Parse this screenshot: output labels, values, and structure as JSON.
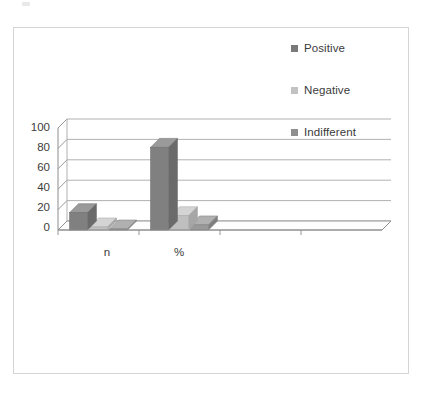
{
  "chart_data": {
    "type": "bar",
    "title": "",
    "subtitle": "",
    "xlabel": "",
    "ylabel": "",
    "categories": [
      "n",
      "%"
    ],
    "series": [
      {
        "name": "Positive",
        "values": [
          17,
          81
        ],
        "color": "#808080"
      },
      {
        "name": "Negative",
        "values": [
          3,
          14
        ],
        "color": "#bfbfbf"
      },
      {
        "name": "Indifferent",
        "values": [
          1,
          5
        ],
        "color": "#999999"
      }
    ],
    "yticks": [
      0,
      20,
      40,
      60,
      80,
      100
    ],
    "ylim": [
      0,
      100
    ],
    "grid": true,
    "legend_position": "right",
    "style": "3d-clustered-column",
    "empty_category_slots": 2
  },
  "legend": {
    "items": [
      {
        "label": "Positive",
        "swatch_color": "#7a7a7a"
      },
      {
        "label": "Negative",
        "swatch_color": "#c2c2c2"
      },
      {
        "label": "Indifferent",
        "swatch_color": "#8f8f8f"
      }
    ]
  },
  "axis": {
    "y_tick_labels": [
      "100",
      "80",
      "60",
      "40",
      "20",
      "0"
    ],
    "x_tick_labels": [
      "n",
      "%"
    ]
  },
  "colors": {
    "frame_border": "#d5d5d5",
    "gridline": "#a8a8a8",
    "axis_line": "#8c8c8c",
    "text": "#3b3b3b",
    "background": "#ffffff",
    "bar_positive_front": "#808080",
    "bar_positive_top": "#9a9a9a",
    "bar_positive_side": "#6a6a6a",
    "bar_negative_front": "#bfbfbf",
    "bar_negative_top": "#d4d4d4",
    "bar_negative_side": "#a6a6a6",
    "bar_indifferent_front": "#999999",
    "bar_indifferent_top": "#b0b0b0",
    "bar_indifferent_side": "#7e7e7e"
  }
}
